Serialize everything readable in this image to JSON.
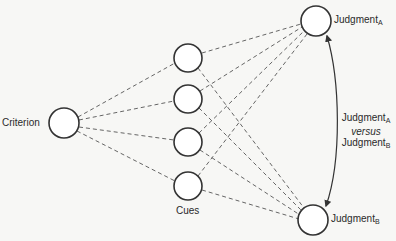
{
  "diagram": {
    "type": "lens-model",
    "nodes": {
      "criterion": {
        "label": "Criterion",
        "cx": 64,
        "cy": 123,
        "r": 15
      },
      "cues": [
        {
          "cx": 188,
          "cy": 58,
          "r": 14
        },
        {
          "cx": 188,
          "cy": 99,
          "r": 14
        },
        {
          "cx": 188,
          "cy": 142,
          "r": 14
        },
        {
          "cx": 188,
          "cy": 186,
          "r": 14
        }
      ],
      "cues_label": "Cues",
      "judgment_a": {
        "label": "Judgment",
        "subscript": "A",
        "cx": 316,
        "cy": 21,
        "r": 15
      },
      "judgment_b": {
        "label": "Judgment",
        "subscript": "B",
        "cx": 313,
        "cy": 220,
        "r": 15
      }
    },
    "comparison": {
      "line1": "Judgment",
      "line1_sub": "A",
      "versus": "versus",
      "line3": "Judgment",
      "line3_sub": "B"
    },
    "colors": {
      "background": "#f7f7f5",
      "stroke": "#333333",
      "dashed": "#555555"
    }
  }
}
